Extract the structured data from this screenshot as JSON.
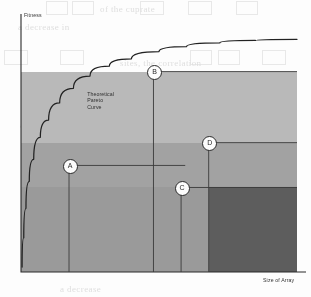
{
  "figure": {
    "background_color": "#fdfdfc",
    "axis_color": "#2b2b2b",
    "curve_color": "#222222"
  },
  "chart_data": {
    "type": "area",
    "title": "",
    "subtitle": "",
    "xlabel": "Size of Array",
    "ylabel": "Fitness",
    "grid": false,
    "legend_position": "none",
    "xlim": [
      0,
      100
    ],
    "ylim": [
      0,
      100
    ],
    "x_tick_labels": [],
    "y_tick_labels": [],
    "annotations": [
      {
        "name": "pareto-curve-label",
        "text_lines": [
          "Theoretical",
          "Pareto",
          "Curve"
        ],
        "x": 24,
        "y": 74
      }
    ],
    "series": [
      {
        "name": "Theoretical Pareto Curve",
        "type": "line",
        "color": "#222222",
        "points": [
          [
            0.4,
            2
          ],
          [
            1.0,
            14
          ],
          [
            1.8,
            26
          ],
          [
            3.0,
            37
          ],
          [
            4.6,
            46
          ],
          [
            7.0,
            55
          ],
          [
            10.0,
            62
          ],
          [
            14.0,
            69
          ],
          [
            19.0,
            75
          ],
          [
            25.0,
            80
          ],
          [
            32.0,
            84
          ],
          [
            40.0,
            87
          ],
          [
            50.0,
            90
          ],
          [
            60.0,
            92
          ],
          [
            72.0,
            93.5
          ],
          [
            85.0,
            94.5
          ],
          [
            100.0,
            95
          ]
        ]
      }
    ],
    "rectangles": [
      {
        "label": "A",
        "name": "solution-rect-a",
        "fill": "#b4b4b4",
        "x0": 0,
        "x1": 59.5,
        "y0": 0,
        "y1": 43.5,
        "corner_x": 17.4,
        "corner_y": 43.5,
        "z": 10
      },
      {
        "label": "B",
        "name": "solution-rect-b",
        "fill": "#b9b9b9",
        "x0": 0,
        "x1": 100,
        "y0": 0,
        "y1": 81.8,
        "corner_x": 48.0,
        "corner_y": 81.8,
        "z": 12
      },
      {
        "label": "C",
        "name": "solution-rect-c",
        "fill": "#9a9a9a",
        "x0": 0,
        "x1": 100,
        "y0": 0,
        "y1": 34.5,
        "corner_x": 58.0,
        "corner_y": 34.5,
        "z": 14
      },
      {
        "label": "D",
        "name": "solution-rect-d",
        "fill": "#a2a2a2",
        "x0": 0,
        "x1": 100,
        "y0": 0,
        "y1": 52.8,
        "corner_x": 68.0,
        "corner_y": 52.8,
        "z": 13
      }
    ],
    "markers": [
      {
        "label": "A",
        "x": 17.4,
        "y": 43.5
      },
      {
        "label": "B",
        "x": 48.0,
        "y": 81.8
      },
      {
        "label": "C",
        "x": 58.0,
        "y": 34.5
      },
      {
        "label": "D",
        "x": 68.0,
        "y": 52.8
      }
    ]
  },
  "ghost_text": {
    "lines": [
      {
        "text": "of the cuprate",
        "x": 100,
        "y": 4
      },
      {
        "text": "a decrease in",
        "x": 18,
        "y": 22
      },
      {
        "text": "sites, the correlation",
        "x": 120,
        "y": 58
      },
      {
        "text": "an increase in",
        "x": 20,
        "y": 120
      },
      {
        "text": "to recreate",
        "x": 95,
        "y": 137
      },
      {
        "text": "a decrease",
        "x": 60,
        "y": 284
      }
    ],
    "boxes": [
      {
        "x": 46,
        "y": 1,
        "w": 20,
        "h": 12
      },
      {
        "x": 72,
        "y": 1,
        "w": 20,
        "h": 12
      },
      {
        "x": 140,
        "y": 1,
        "w": 22,
        "h": 12
      },
      {
        "x": 188,
        "y": 1,
        "w": 22,
        "h": 12
      },
      {
        "x": 236,
        "y": 1,
        "w": 20,
        "h": 12
      },
      {
        "x": 4,
        "y": 50,
        "w": 22,
        "h": 13
      },
      {
        "x": 60,
        "y": 50,
        "w": 22,
        "h": 13
      },
      {
        "x": 190,
        "y": 50,
        "w": 20,
        "h": 13
      },
      {
        "x": 218,
        "y": 50,
        "w": 20,
        "h": 13
      },
      {
        "x": 262,
        "y": 50,
        "w": 22,
        "h": 13
      }
    ]
  }
}
